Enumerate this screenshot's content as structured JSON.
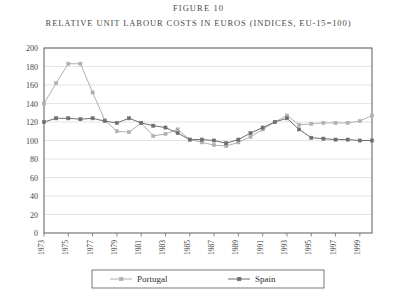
{
  "figure": {
    "label": "FIGURE 10",
    "title": "RELATIVE UNIT LABOUR COSTS IN EUROS (INDICES, EU-15=100)"
  },
  "colors": {
    "portugal": "#b0b0b0",
    "spain": "#6e6e6e",
    "frame": "#6b6b6b",
    "gridline": "#d8d8d8",
    "text": "#3f3f3f",
    "background": "#ffffff"
  },
  "legend": {
    "position": "bottom",
    "entries": [
      {
        "label": "Portugal",
        "color": "#b0b0b0"
      },
      {
        "label": "Spain",
        "color": "#6e6e6e"
      }
    ]
  },
  "axes": {
    "y_ticks": [
      "200",
      "180",
      "160",
      "140",
      "120",
      "100",
      "80",
      "60",
      "40",
      "20",
      "0"
    ],
    "x_ticks": [
      "1973",
      "1975",
      "1977",
      "1979",
      "1981",
      "1983",
      "1985",
      "1987",
      "1989",
      "1991",
      "1993",
      "1995",
      "1997",
      "1999"
    ]
  },
  "chart_data": {
    "type": "line",
    "title": "RELATIVE UNIT LABOUR COSTS IN EUROS (INDICES, EU-15=100)",
    "subtitle": "FIGURE 10",
    "xlabel": "",
    "ylabel": "",
    "ylim": [
      0,
      200
    ],
    "ytick_step": 20,
    "grid": true,
    "legend_position": "bottom",
    "x": [
      1973,
      1974,
      1975,
      1976,
      1977,
      1978,
      1979,
      1980,
      1981,
      1982,
      1983,
      1984,
      1985,
      1986,
      1987,
      1988,
      1989,
      1990,
      1991,
      1992,
      1993,
      1994,
      1995,
      1996,
      1997,
      1998,
      1999,
      2000
    ],
    "series": [
      {
        "name": "Portugal",
        "color": "#b0b0b0",
        "values": [
          140,
          162,
          183,
          183,
          152,
          122,
          110,
          109,
          119,
          105,
          107,
          112,
          101,
          98,
          95,
          94,
          98,
          104,
          112,
          120,
          127,
          117,
          118,
          119,
          119,
          119,
          121,
          127
        ]
      },
      {
        "name": "Spain",
        "color": "#6e6e6e",
        "values": [
          120,
          124,
          124,
          123,
          124,
          121,
          119,
          124,
          119,
          116,
          114,
          108,
          101,
          101,
          100,
          97,
          101,
          108,
          114,
          120,
          124,
          112,
          103,
          102,
          101,
          101,
          100,
          100
        ]
      }
    ]
  }
}
